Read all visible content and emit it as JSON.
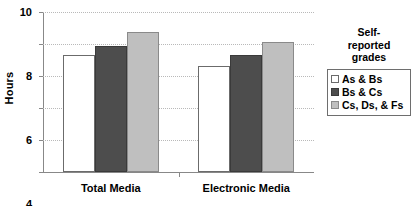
{
  "chart_data": {
    "type": "bar",
    "title": "",
    "xlabel": "",
    "ylabel": "Hours",
    "ylim": [
      0,
      10
    ],
    "yticks": [
      0,
      2,
      4,
      6,
      8,
      10
    ],
    "ytick_labels": [
      "0",
      "2",
      "4",
      "6",
      "8",
      "10"
    ],
    "grid": true,
    "categories": [
      "Total Media",
      "Electronic Media"
    ],
    "legend_position": "right",
    "legend_title": "Self-reported grades",
    "legend_title_lines": [
      "Self-",
      "reported",
      "grades"
    ],
    "series": [
      {
        "name": "As & Bs",
        "values": [
          7.3,
          6.6
        ],
        "color": "#ffffff",
        "border": "#6b6b6b"
      },
      {
        "name": "Bs & Cs",
        "values": [
          7.9,
          7.3
        ],
        "color": "#4d4d4d",
        "border": "#3a3a3a"
      },
      {
        "name": "Cs, Ds, & Fs",
        "values": [
          8.75,
          8.1
        ],
        "color": "#bfbfbf",
        "border": "#8a8a8a"
      }
    ]
  },
  "axis": {
    "y_title": "Hours",
    "tick_0": "0",
    "tick_2": "2",
    "tick_4": "4",
    "tick_6": "6",
    "tick_8": "8",
    "tick_10": "10"
  },
  "groups": {
    "g0": "Total Media",
    "g1": "Electronic Media"
  },
  "legend": {
    "title_line_1": "Self-",
    "title_line_2": "reported",
    "title_line_3": "grades",
    "item_0": "As & Bs",
    "item_1": "Bs & Cs",
    "item_2": "Cs, Ds, & Fs"
  }
}
